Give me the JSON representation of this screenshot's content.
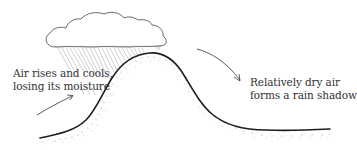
{
  "diagram": {
    "labels": {
      "windward": {
        "line1": "Air rises and cools,",
        "line2": "losing its moisture"
      },
      "leeward": {
        "line1": "Relatively dry air",
        "line2": "forms a rain shadow"
      }
    },
    "elements": {
      "cloud": "rain-cloud",
      "rain": "rain-streaks",
      "mountain": "mountain-profile",
      "arrow_up": "rising-air-arrow",
      "arrow_down": "descending-air-arrow"
    },
    "colors": {
      "line": "#222222",
      "text": "#333333",
      "stipple": "#888888",
      "rain": "#aaaaaa",
      "background": "#ffffff"
    }
  }
}
